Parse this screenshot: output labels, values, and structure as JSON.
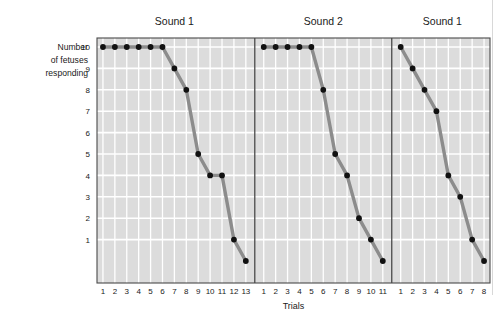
{
  "figure": {
    "ylabel_lines": [
      "Number",
      "of fetuses",
      "responding"
    ],
    "xlabel": "Trials",
    "y_ticks": [
      "10",
      "9",
      "8",
      "7",
      "6",
      "5",
      "4",
      "3",
      "2",
      "1"
    ],
    "colors": {
      "plot_background": "#dcdcdc",
      "gridline": "#ffffff",
      "axis_line": "#4a4a4a",
      "series_line": "#8c8c8c",
      "marker": "#111111",
      "text": "#1a1a1a"
    }
  },
  "chart_data": {
    "type": "line",
    "title": "",
    "xlabel": "Trials",
    "ylabel": "Number of fetuses responding",
    "ylim": [
      0,
      10
    ],
    "yticks": [
      1,
      2,
      3,
      4,
      5,
      6,
      7,
      8,
      9,
      10
    ],
    "grid": true,
    "legend": "none",
    "panels": [
      {
        "title": "Sound 1",
        "x": [
          1,
          2,
          3,
          4,
          5,
          6,
          7,
          8,
          9,
          10,
          11,
          12,
          13
        ],
        "xticklabels": [
          "1",
          "2",
          "3",
          "4",
          "5",
          "6",
          "7",
          "8",
          "9",
          "10",
          "11",
          "12",
          "13"
        ],
        "values": [
          10,
          10,
          10,
          10,
          10,
          10,
          9,
          8,
          5,
          4,
          4,
          1,
          0
        ]
      },
      {
        "title": "Sound 2",
        "x": [
          1,
          2,
          3,
          4,
          5,
          6,
          7,
          8,
          9,
          10,
          11
        ],
        "xticklabels": [
          "1",
          "2",
          "3",
          "4",
          "5",
          "6",
          "7",
          "8",
          "9",
          "10",
          "11"
        ],
        "values": [
          10,
          10,
          10,
          10,
          10,
          8,
          5,
          4,
          2,
          1,
          0
        ]
      },
      {
        "title": "Sound 1",
        "x": [
          1,
          2,
          3,
          4,
          5,
          6,
          7,
          8
        ],
        "xticklabels": [
          "1",
          "2",
          "3",
          "4",
          "5",
          "6",
          "7",
          "8"
        ],
        "values": [
          10,
          9,
          8,
          7,
          4,
          3,
          1,
          0
        ]
      }
    ]
  }
}
